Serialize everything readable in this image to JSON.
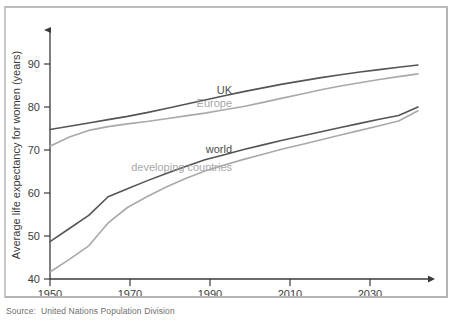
{
  "figure": {
    "source_note": "Source:  United Nations Population Division",
    "frame_color": "#b4b4b4"
  },
  "chart_data": {
    "type": "line",
    "title": "",
    "xlabel": "Year",
    "ylabel": "Average life expectancy for women (years)",
    "xlim": [
      1950,
      2045
    ],
    "ylim": [
      40,
      92
    ],
    "xticks": [
      1950,
      1970,
      1990,
      2010,
      2030
    ],
    "yticks": [
      40,
      50,
      60,
      70,
      80,
      90
    ],
    "xtick_labels": [
      "1950",
      "1970",
      "1990",
      "2010",
      "2030"
    ],
    "ytick_labels": [
      "40",
      "50",
      "60",
      "70",
      "80",
      "90"
    ],
    "grid": false,
    "legend_position": "inline-annotations",
    "colors": {
      "dark": "#555555",
      "light": "#a9a9a9"
    },
    "x": [
      1950,
      1955,
      1960,
      1965,
      1970,
      1975,
      1980,
      1985,
      1990,
      1995,
      2000,
      2005,
      2010,
      2015,
      2020,
      2025,
      2030,
      2035,
      2040,
      2045
    ],
    "series": [
      {
        "name": "UK",
        "label": "UK",
        "color": "#555555",
        "label_x": 1997,
        "label_y": 79.6,
        "values": [
          72.0,
          72.7,
          73.4,
          74.1,
          74.8,
          75.6,
          76.5,
          77.4,
          78.3,
          79.2,
          80.1,
          80.9,
          81.7,
          82.4,
          83.1,
          83.7,
          84.3,
          84.8,
          85.3,
          85.8
        ]
      },
      {
        "name": "Europe",
        "label": "Europe",
        "color": "#a9a9a9",
        "label_x": 1997,
        "label_y": 76.8,
        "values": [
          68.4,
          70.4,
          71.8,
          72.6,
          73.2,
          73.7,
          74.3,
          74.9,
          75.5,
          76.2,
          76.9,
          77.8,
          78.7,
          79.6,
          80.5,
          81.3,
          82.0,
          82.7,
          83.3,
          83.9
        ]
      },
      {
        "name": "world",
        "label": "world",
        "color": "#555555",
        "label_x": 1997,
        "label_y": 67.0,
        "values": [
          48.0,
          50.8,
          53.6,
          57.6,
          59.3,
          61.0,
          62.6,
          64.1,
          65.5,
          66.6,
          67.7,
          68.7,
          69.7,
          70.6,
          71.5,
          72.4,
          73.3,
          74.2,
          75.0,
          76.8
        ]
      },
      {
        "name": "developing countries",
        "label": "developing countries",
        "color": "#a9a9a9",
        "label_x": 1997,
        "label_y": 63.2,
        "values": [
          41.5,
          44.2,
          47.1,
          52.0,
          55.3,
          57.6,
          59.7,
          61.5,
          63.1,
          64.4,
          65.6,
          66.7,
          67.8,
          68.8,
          69.8,
          70.8,
          71.8,
          72.8,
          73.8,
          76.0
        ]
      }
    ]
  }
}
